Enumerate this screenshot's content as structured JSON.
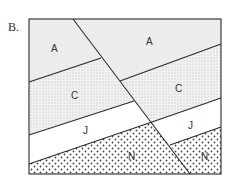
{
  "figure_label": "B.",
  "layers": [
    {
      "id": "A",
      "label": "A",
      "pattern": "light-gray"
    },
    {
      "id": "C",
      "label": "C",
      "pattern": "fine-stipple"
    },
    {
      "id": "J",
      "label": "J",
      "pattern": "blank"
    },
    {
      "id": "N",
      "label": "N",
      "pattern": "coarse-dots"
    }
  ],
  "labels": {
    "left_A": "A",
    "right_A": "A",
    "left_C": "C",
    "right_C": "C",
    "left_J": "J",
    "right_J": "J",
    "left_N": "N",
    "right_N": "N"
  },
  "colors": {
    "outline": "#2a2a2a",
    "layer_A": "#ececec",
    "layer_C": "#e6e6e6",
    "layer_J": "#ffffff",
    "layer_N": "#ffffff"
  }
}
